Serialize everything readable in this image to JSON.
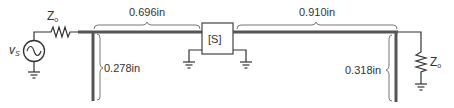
{
  "diagram": {
    "source": {
      "label": "v",
      "label_sub": "S",
      "type": "ac-voltage-source"
    },
    "source_impedance": {
      "label": "Z",
      "label_sub": "o"
    },
    "load_impedance": {
      "label": "Z",
      "label_sub": "o"
    },
    "two_port": {
      "label": "[S]"
    },
    "lines": {
      "left_series_length": "0.696in",
      "right_series_length": "0.910in"
    },
    "stubs": {
      "left_stub_length": "0.278in",
      "right_stub_length": "0.318in"
    },
    "colors": {
      "line_stroke": "#555555",
      "wire_stroke": "#333333",
      "bracket_stroke": "#666666",
      "text": "#333333"
    }
  }
}
